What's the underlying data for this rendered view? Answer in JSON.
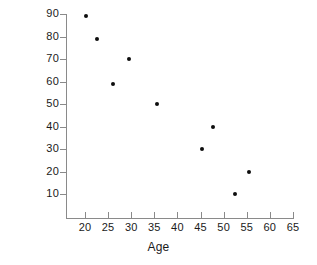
{
  "chart_data": {
    "type": "scatter",
    "title": "",
    "xlabel": "Age",
    "ylabel": "Test Scores",
    "xlim": [
      17,
      66
    ],
    "ylim": [
      4,
      92
    ],
    "xticks": [
      20,
      25,
      30,
      35,
      40,
      45,
      50,
      55,
      60,
      65
    ],
    "yticks": [
      10,
      20,
      30,
      40,
      50,
      60,
      70,
      80,
      90
    ],
    "xtick_labels": [
      "20",
      "25",
      "30",
      "35",
      "40",
      "45",
      "50",
      "55",
      "60",
      "65"
    ],
    "ytick_labels": [
      "10",
      "20",
      "30",
      "40",
      "50",
      "60",
      "70",
      "80",
      "90"
    ],
    "grid": false,
    "legend": null,
    "marker": "filled-circle",
    "marker_color": "#0d0d0d",
    "axis_color": "#8a8a8a",
    "background_color": "#ffffff",
    "series": [
      {
        "name": "Test Scores by Age",
        "x": [
          20.3,
          22.5,
          26.0,
          29.5,
          35.5,
          45.3,
          47.7,
          52.5,
          55.5
        ],
        "y": [
          89,
          79,
          59,
          70,
          50,
          30,
          40,
          10,
          20
        ]
      }
    ],
    "points": [
      {
        "age": 20.3,
        "score": 89
      },
      {
        "age": 22.5,
        "score": 79
      },
      {
        "age": 26.0,
        "score": 59
      },
      {
        "age": 29.5,
        "score": 70
      },
      {
        "age": 35.5,
        "score": 50
      },
      {
        "age": 45.3,
        "score": 30
      },
      {
        "age": 47.7,
        "score": 40
      },
      {
        "age": 52.5,
        "score": 10
      },
      {
        "age": 55.5,
        "score": 20
      }
    ]
  }
}
